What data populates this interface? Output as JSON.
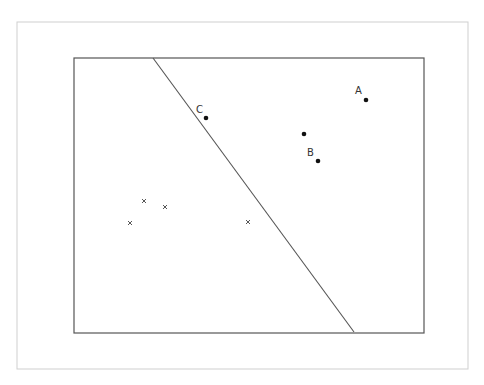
{
  "diagram": {
    "type": "linear-classifier-separating-line",
    "labels": {
      "A": "A",
      "B": "B",
      "C": "C"
    },
    "positive_points": [
      {
        "name": "A",
        "x": 366,
        "y": 100
      },
      {
        "name": "C",
        "x": 206,
        "y": 118
      },
      {
        "name": "",
        "x": 304,
        "y": 134
      },
      {
        "name": "B",
        "x": 318,
        "y": 161
      }
    ],
    "negative_points": [
      {
        "x": 144,
        "y": 201
      },
      {
        "x": 165,
        "y": 207
      },
      {
        "x": 130,
        "y": 223
      },
      {
        "x": 248,
        "y": 222
      }
    ],
    "decision_boundary": {
      "x1": 153,
      "y1": 58,
      "x2": 354,
      "y2": 332
    }
  }
}
